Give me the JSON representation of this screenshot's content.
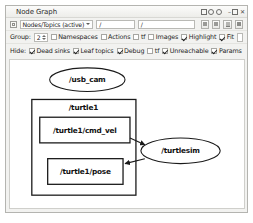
{
  "window": {
    "title": "Node Graph",
    "controls": {
      "detach_icon": "detach-icon",
      "help_icon": "help-icon",
      "gear_icon": "gear-icon",
      "minimize_icon": "minimize-icon",
      "float_icon": "float-icon",
      "close_icon": "close-icon"
    }
  },
  "toolbar_row1": {
    "refresh_icon": "refresh-icon",
    "graph_type": "Nodes/Topics (active)",
    "caret_icon": "chevron-down-icon",
    "filter_1_value": "/",
    "filter_2_value": "/",
    "buttons": [
      {
        "name": "save-dot-button",
        "icon": "file-dot-icon"
      },
      {
        "name": "save-svg-button",
        "icon": "file-svg-icon"
      },
      {
        "name": "save-image-button",
        "icon": "image-icon"
      },
      {
        "name": "load-button",
        "icon": "folder-icon"
      }
    ]
  },
  "toolbar_row2": {
    "group_label": "Group:",
    "group_value": "2",
    "namespaces_label": "Namespaces",
    "namespaces_checked": true,
    "actions_label": "Actions",
    "actions_checked": true,
    "tf_label": "tf",
    "tf_checked": false,
    "images_label": "Images",
    "images_checked": false,
    "highlight_label": "Highlight",
    "highlight_checked": true,
    "fit_label": "Fit",
    "fit_checked": true,
    "highlight_field_value": ""
  },
  "toolbar_row3": {
    "hide_label": "Hide:",
    "items": [
      {
        "label": "Dead sinks",
        "checked": true
      },
      {
        "label": "Leaf topics",
        "checked": true
      },
      {
        "label": "Debug",
        "checked": true
      },
      {
        "label": "tf",
        "checked": false
      },
      {
        "label": "Unreachable",
        "checked": true
      },
      {
        "label": "Params",
        "checked": true
      }
    ]
  },
  "graph": {
    "nodes": [
      {
        "id": "usb_cam",
        "label": "/usb_cam",
        "shape": "ellipse"
      },
      {
        "id": "turtlesim",
        "label": "/turtlesim",
        "shape": "ellipse"
      }
    ],
    "groups": [
      {
        "id": "turtle1",
        "label": "/turtle1",
        "shape": "box"
      }
    ],
    "topics": [
      {
        "id": "cmd_vel",
        "label": "/turtle1/cmd_vel",
        "shape": "box"
      },
      {
        "id": "pose",
        "label": "/turtle1/pose",
        "shape": "box"
      }
    ],
    "edges": [
      {
        "from": "cmd_vel",
        "to": "turtlesim"
      },
      {
        "from": "turtlesim",
        "to": "pose"
      }
    ],
    "colors": {
      "node_stroke": "#1a1a1a",
      "node_fill": "#ffffff",
      "edge": "#1a1a1a",
      "canvas": "#ffffff"
    }
  }
}
